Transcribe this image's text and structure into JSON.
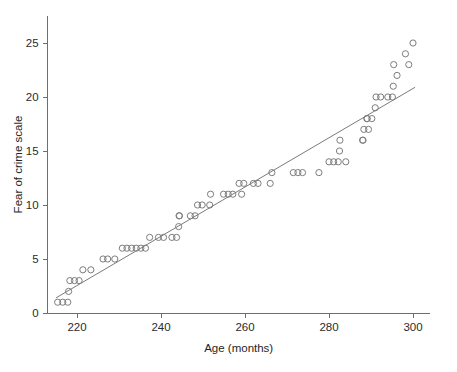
{
  "chart_data": {
    "type": "scatter",
    "title": "",
    "xlabel": "Age (months)",
    "ylabel": "Fear of crime scale",
    "xlim": [
      213,
      304
    ],
    "ylim": [
      0,
      27.5
    ],
    "xticks": [
      220,
      240,
      260,
      280,
      300
    ],
    "xtick_labels": [
      "220",
      "240",
      "260",
      "280",
      "300"
    ],
    "yticks": [
      0,
      5,
      10,
      15,
      20,
      25
    ],
    "ytick_labels": [
      "0",
      "5",
      "10",
      "15",
      "20",
      "25"
    ],
    "grid": false,
    "legend": null,
    "marker_style": "open-circle",
    "marker_color": "#7d7d7d",
    "line_color": "#6b6b6b",
    "series": [
      {
        "name": "Fear of crime scale",
        "points": [
          [
            215.4,
            1
          ],
          [
            216.6,
            1
          ],
          [
            217.8,
            1
          ],
          [
            218.0,
            2
          ],
          [
            218.3,
            3
          ],
          [
            219.4,
            3
          ],
          [
            220.5,
            3
          ],
          [
            221.4,
            4
          ],
          [
            223.3,
            4
          ],
          [
            226.2,
            5
          ],
          [
            227.3,
            5
          ],
          [
            229.0,
            5
          ],
          [
            230.8,
            6
          ],
          [
            231.9,
            6
          ],
          [
            233.0,
            6
          ],
          [
            234.1,
            6
          ],
          [
            235.2,
            6
          ],
          [
            236.3,
            6
          ],
          [
            237.3,
            7
          ],
          [
            239.4,
            7
          ],
          [
            240.6,
            7
          ],
          [
            242.6,
            7
          ],
          [
            243.7,
            7
          ],
          [
            244.2,
            8
          ],
          [
            244.3,
            9
          ],
          [
            244.4,
            9
          ],
          [
            247.0,
            9
          ],
          [
            248.1,
            9
          ],
          [
            248.7,
            10
          ],
          [
            249.8,
            10
          ],
          [
            251.6,
            10
          ],
          [
            251.8,
            11
          ],
          [
            254.9,
            11
          ],
          [
            256.0,
            11
          ],
          [
            257.1,
            11
          ],
          [
            259.2,
            11
          ],
          [
            258.6,
            12
          ],
          [
            259.7,
            12
          ],
          [
            262.0,
            12
          ],
          [
            263.1,
            12
          ],
          [
            266.0,
            12
          ],
          [
            266.4,
            13
          ],
          [
            271.5,
            13
          ],
          [
            272.6,
            13
          ],
          [
            273.7,
            13
          ],
          [
            277.6,
            13
          ],
          [
            280.0,
            14
          ],
          [
            281.1,
            14
          ],
          [
            282.2,
            14
          ],
          [
            284.0,
            14
          ],
          [
            282.5,
            15
          ],
          [
            282.6,
            16
          ],
          [
            288.0,
            16
          ],
          [
            288.1,
            16
          ],
          [
            288.3,
            17
          ],
          [
            289.4,
            17
          ],
          [
            289.0,
            18
          ],
          [
            289.1,
            18
          ],
          [
            290.2,
            18
          ],
          [
            291.0,
            19
          ],
          [
            291.2,
            20
          ],
          [
            292.3,
            20
          ],
          [
            294.0,
            20
          ],
          [
            295.1,
            20
          ],
          [
            295.3,
            21
          ],
          [
            296.2,
            22
          ],
          [
            295.4,
            23
          ],
          [
            299.0,
            23
          ],
          [
            298.2,
            24
          ],
          [
            300.0,
            25
          ]
        ]
      }
    ],
    "fit_line": {
      "name": "regression line",
      "x_start": 215.0,
      "y_start": 1.4,
      "x_end": 300.5,
      "y_end": 20.9
    }
  },
  "axes": {
    "x_axis_name": "Age (months)",
    "y_axis_name": "Fear of crime scale"
  }
}
